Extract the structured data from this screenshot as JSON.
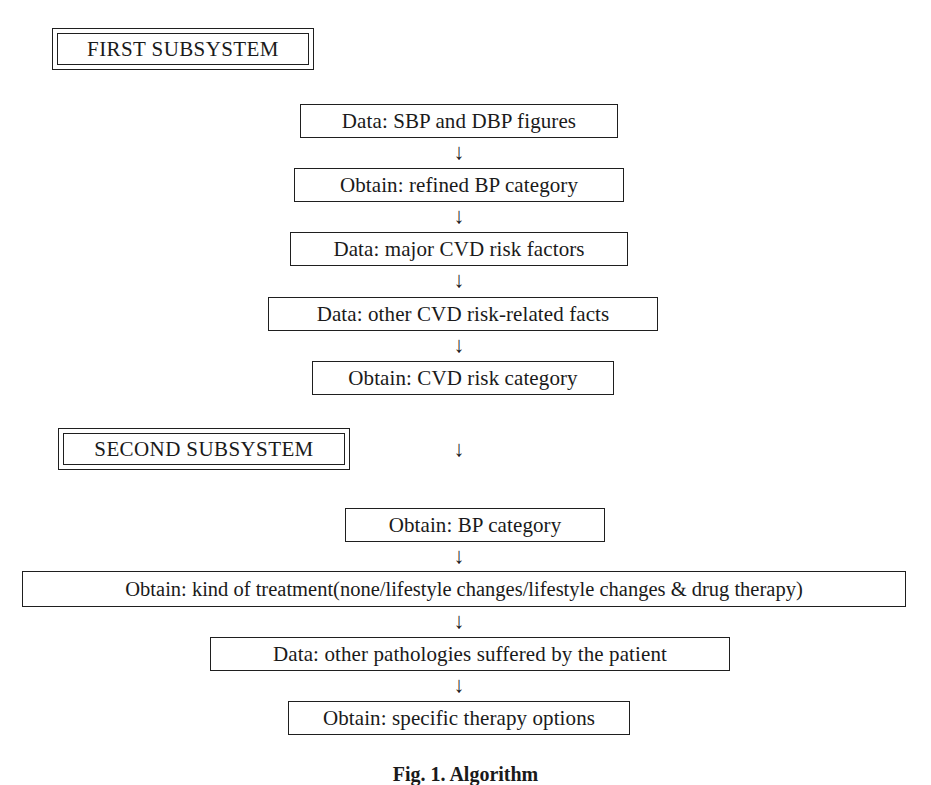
{
  "figure": {
    "caption": "Fig. 1. Algorithm",
    "background_color": "#ffffff",
    "ink_color": "#1f1f1f"
  },
  "subsystems": [
    {
      "label": "FIRST SUBSYSTEM"
    },
    {
      "label": "SECOND SUBSYSTEM"
    }
  ],
  "nodes": [
    {
      "label": "Data: SBP and DBP figures"
    },
    {
      "label": "Obtain: refined BP category"
    },
    {
      "label": "Data: major CVD risk factors"
    },
    {
      "label": "Data: other CVD risk-related facts"
    },
    {
      "label": "Obtain: CVD risk category"
    },
    {
      "label": "Obtain: BP category"
    },
    {
      "label": "Obtain: kind of treatment(none/lifestyle changes/lifestyle changes & drug therapy)"
    },
    {
      "label": "Data: other pathologies suffered by the patient"
    },
    {
      "label": "Obtain: specific therapy options"
    }
  ],
  "arrows": [
    {
      "glyph": "↓"
    },
    {
      "glyph": "↓"
    },
    {
      "glyph": "↓"
    },
    {
      "glyph": "↓"
    },
    {
      "glyph": "↓"
    },
    {
      "glyph": "↓"
    },
    {
      "glyph": "↓"
    },
    {
      "glyph": "↓"
    }
  ]
}
